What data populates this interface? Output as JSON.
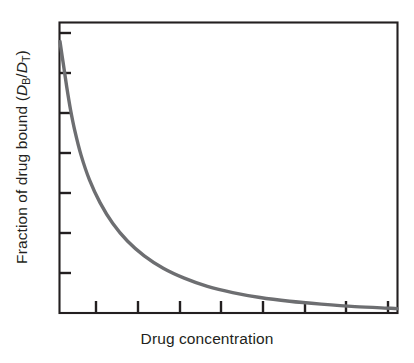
{
  "figure": {
    "background_color": "#ffffff",
    "frame_color": "#231f20",
    "curve_color": "#6d6e71",
    "text_color": "#231f20"
  },
  "axes": {
    "x_title": "Drug concentration",
    "y_title_prefix": "Fraction of drug bound (",
    "y_title_numerator_var": "D",
    "y_title_numerator_sub": "B",
    "y_title_divider": "/",
    "y_title_denominator_var": "D",
    "y_title_denominator_sub": "T",
    "y_title_suffix": ")"
  },
  "chart_data": {
    "type": "line",
    "title": "",
    "xlabel": "Drug concentration",
    "ylabel": "Fraction of drug bound (DB/DT)",
    "xlim": [
      0,
      8
    ],
    "ylim": [
      0,
      7
    ],
    "x_tick_labels": [
      "",
      "",
      "",
      "",
      "",
      "",
      "",
      ""
    ],
    "y_tick_labels": [
      "",
      "",
      "",
      "",
      "",
      "",
      ""
    ],
    "x_ticks": [
      1,
      2,
      3,
      4,
      5,
      6,
      7,
      8
    ],
    "y_ticks": [
      7,
      6,
      5,
      4,
      3,
      2,
      1
    ],
    "grid": false,
    "legend": "none",
    "series": [
      {
        "name": "Fraction of drug bound",
        "description": "Monotonically decreasing saturable binding curve; fraction bound falls steeply at low drug concentration then approaches zero asymptotically.",
        "x": [
          0.0,
          0.08,
          0.16,
          0.25,
          0.35,
          0.5,
          0.7,
          0.95,
          1.25,
          1.6,
          2.0,
          2.45,
          2.95,
          3.5,
          4.1,
          4.75,
          5.45,
          6.2,
          7.0,
          7.85,
          8.0
        ],
        "y": [
          6.55,
          6.0,
          5.45,
          4.9,
          4.4,
          3.8,
          3.2,
          2.65,
          2.15,
          1.72,
          1.36,
          1.06,
          0.82,
          0.62,
          0.47,
          0.35,
          0.26,
          0.19,
          0.13,
          0.09,
          0.08
        ]
      }
    ]
  }
}
